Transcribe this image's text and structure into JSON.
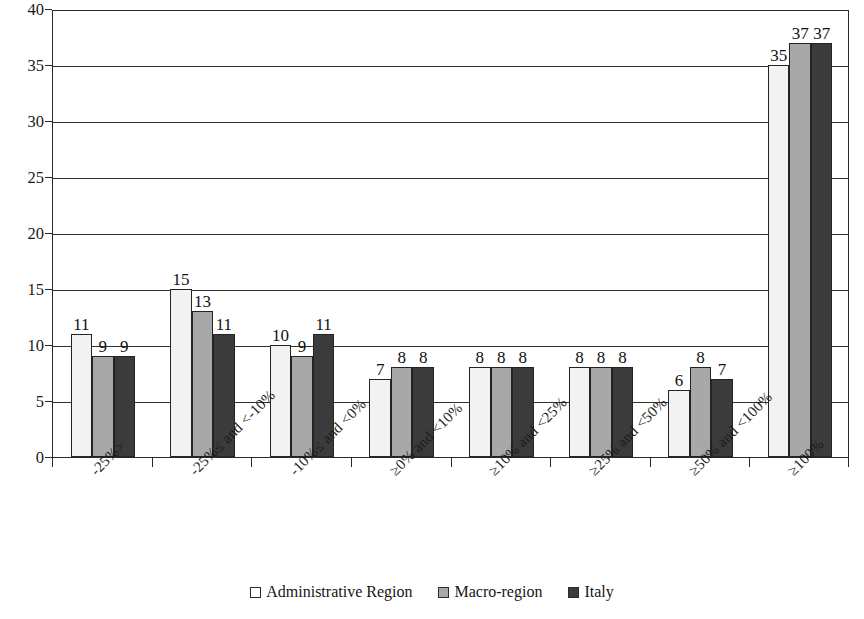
{
  "chart_data": {
    "type": "bar",
    "title": "",
    "xlabel": "",
    "ylabel": "",
    "ylim": [
      0,
      40
    ],
    "ytick_step": 5,
    "yticks": [
      0,
      5,
      10,
      15,
      20,
      25,
      30,
      35,
      40
    ],
    "grid": true,
    "grid_axis": "y",
    "legend_position": "bottom-center",
    "bar_labels_shown": true,
    "category_label_rotation": -45,
    "categories": [
      "-25%>",
      "-25%≤ and <-10%",
      "-10%≤ and <0%",
      "≥0% and <10%",
      "≥10% and <25%",
      "≥25% and <50%",
      "≥50% and <100%",
      "≥100%"
    ],
    "series": [
      {
        "name": "Administrative Region",
        "color": "#f2f2f2",
        "values": [
          11,
          15,
          10,
          7,
          8,
          8,
          6,
          35
        ]
      },
      {
        "name": "Macro-region",
        "color": "#a8a8a8",
        "values": [
          9,
          13,
          9,
          8,
          8,
          8,
          8,
          37
        ]
      },
      {
        "name": "Italy",
        "color": "#3b3b3b",
        "values": [
          9,
          11,
          11,
          8,
          8,
          8,
          7,
          37
        ]
      }
    ]
  },
  "legend": {
    "items": [
      {
        "label": "Administrative Region",
        "swatch": "legend-swatch-white"
      },
      {
        "label": "Macro-region",
        "swatch": "legend-swatch-gray"
      },
      {
        "label": "Italy",
        "swatch": "legend-swatch-dark"
      }
    ]
  },
  "axis": {
    "y_tick_labels": [
      "40",
      "35",
      "30",
      "25",
      "20",
      "15",
      "10",
      "5",
      "0"
    ]
  }
}
